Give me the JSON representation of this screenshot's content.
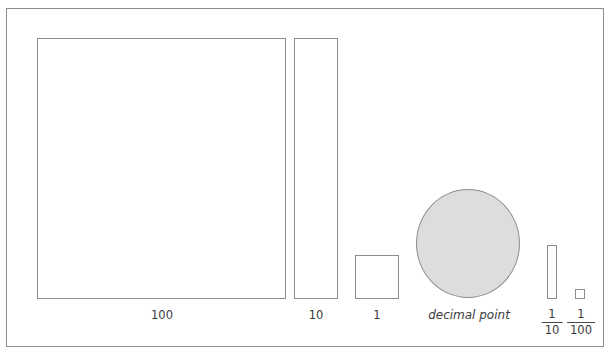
{
  "diagram": {
    "frame": {
      "border_color": "#8d8d8d",
      "background": "#ffffff"
    },
    "palette": {
      "stroke": "#8d8d8d",
      "fill_white": "#ffffff",
      "fill_gray": "#dddddd",
      "text": "#3a3a3a"
    },
    "blocks": [
      {
        "name": "hundred",
        "label": "100",
        "shape": "square",
        "fill": "#ffffff"
      },
      {
        "name": "ten",
        "label": "10",
        "shape": "tall-rectangle",
        "fill": "#ffffff"
      },
      {
        "name": "one",
        "label": "1",
        "shape": "square",
        "fill": "#ffffff"
      },
      {
        "name": "decimal-point",
        "label": "decimal point",
        "shape": "circle",
        "fill": "#dddddd"
      },
      {
        "name": "tenth",
        "label_numerator": "1",
        "label_denominator": "10",
        "shape": "thin-rectangle",
        "fill": "#ffffff"
      },
      {
        "name": "hundredth",
        "label_numerator": "1",
        "label_denominator": "100",
        "shape": "tiny-square",
        "fill": "#ffffff"
      }
    ]
  }
}
